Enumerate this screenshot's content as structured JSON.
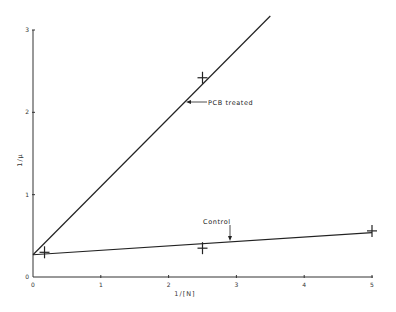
{
  "chart_data": {
    "type": "line",
    "title": "",
    "xlabel": "1/[N]",
    "ylabel": "1/μ",
    "xlim": [
      0,
      5
    ],
    "ylim": [
      0,
      3
    ],
    "x_ticks": [
      "0",
      "1",
      "2",
      "3",
      "4",
      "5"
    ],
    "y_ticks": [
      "0",
      "1",
      "2",
      "3"
    ],
    "grid": false,
    "legend": null,
    "series": [
      {
        "name": "PCB treated",
        "kind": "fitted_line",
        "line": [
          [
            0,
            0.27
          ],
          [
            3.5,
            3.17
          ]
        ],
        "points": [
          [
            2.5,
            2.42
          ]
        ]
      },
      {
        "name": "Control",
        "kind": "fitted_line",
        "line": [
          [
            0,
            0.27
          ],
          [
            5,
            0.54
          ]
        ],
        "points": [
          [
            0.17,
            0.3
          ],
          [
            2.5,
            0.35
          ],
          [
            5,
            0.56
          ]
        ]
      }
    ],
    "annotations": [
      {
        "text": "PCB treated",
        "arrow_to": [
          2.25,
          2.18
        ]
      },
      {
        "text": "Control",
        "arrow_to": [
          2.9,
          0.43
        ]
      }
    ]
  }
}
